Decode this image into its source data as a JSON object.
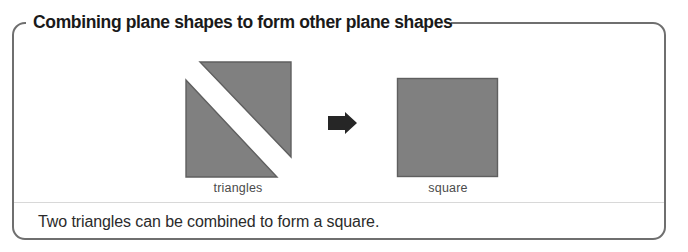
{
  "panel": {
    "title": "Combining plane shapes to form other plane shapes",
    "border_color": "#6f6f6f",
    "background_color": "#ffffff"
  },
  "diagram": {
    "type": "shape-composition",
    "shape_fill_color": "#808080",
    "shape_stroke_color": "#5f5f5f",
    "gap_color": "#ffffff",
    "arrow_color": "#262626",
    "left_figure": {
      "label": "triangles",
      "shape_count": 2,
      "shape_kind": "right-triangle",
      "parts": [
        {
          "name": "upper-right-triangle",
          "right_angle_corner": "top-right",
          "points": "14,2 105,2 105,95"
        },
        {
          "name": "lower-left-triangle",
          "right_angle_corner": "bottom-left",
          "points": "0,18 0,113 91,113"
        }
      ]
    },
    "arrow": {
      "name": "right-arrow",
      "direction": "right",
      "glyph": "arrow-right-icon"
    },
    "right_figure": {
      "label": "square",
      "shape_count": 1,
      "shape_kind": "square",
      "size_px": 100
    }
  },
  "caption": {
    "text": "Two triangles can be combined to form a square."
  }
}
